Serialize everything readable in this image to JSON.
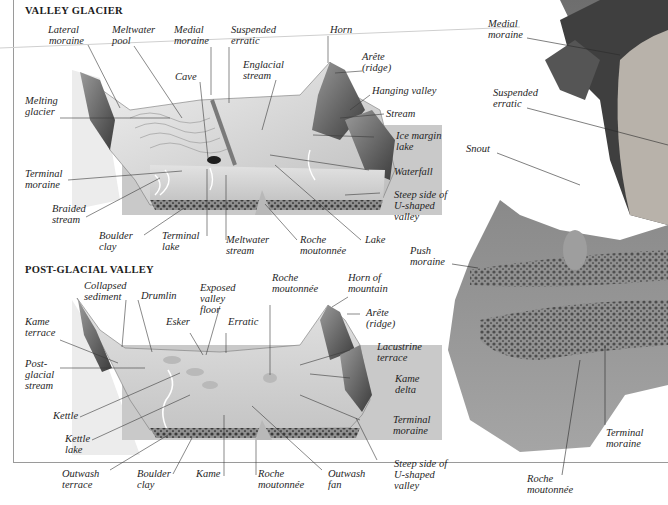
{
  "sections": {
    "valley_glacier": {
      "title": "VALLEY GLACIER",
      "labels": [
        {
          "id": "lateral-moraine",
          "lines": [
            "Lateral",
            "moraine"
          ]
        },
        {
          "id": "meltwater-pool",
          "lines": [
            "Meltwater",
            "pool"
          ]
        },
        {
          "id": "medial-moraine",
          "lines": [
            "Medial",
            "moraine"
          ]
        },
        {
          "id": "suspended-erratic",
          "lines": [
            "Suspended",
            "erratic"
          ]
        },
        {
          "id": "horn",
          "lines": [
            "Horn"
          ]
        },
        {
          "id": "arete",
          "lines": [
            "Arête",
            "(ridge)"
          ]
        },
        {
          "id": "cave",
          "lines": [
            "Cave"
          ]
        },
        {
          "id": "englacial-stream",
          "lines": [
            "Englacial",
            "stream"
          ]
        },
        {
          "id": "hanging-valley",
          "lines": [
            "Hanging valley"
          ]
        },
        {
          "id": "melting-glacier",
          "lines": [
            "Melting",
            "glacier"
          ]
        },
        {
          "id": "stream",
          "lines": [
            "Stream"
          ]
        },
        {
          "id": "ice-margin-lake",
          "lines": [
            "Ice margin",
            "lake"
          ]
        },
        {
          "id": "waterfall",
          "lines": [
            "Waterfall"
          ]
        },
        {
          "id": "terminal-moraine",
          "lines": [
            "Terminal",
            "moraine"
          ]
        },
        {
          "id": "steep-side",
          "lines": [
            "Steep side of",
            "U-shaped",
            "valley"
          ]
        },
        {
          "id": "braided-stream",
          "lines": [
            "Braided",
            "stream"
          ]
        },
        {
          "id": "boulder-clay",
          "lines": [
            "Boulder",
            "clay"
          ]
        },
        {
          "id": "terminal-lake",
          "lines": [
            "Terminal",
            "lake"
          ]
        },
        {
          "id": "meltwater-stream",
          "lines": [
            "Meltwater",
            "stream"
          ]
        },
        {
          "id": "roche-moutonnee",
          "lines": [
            "Roche",
            "moutonnée"
          ]
        },
        {
          "id": "lake",
          "lines": [
            "Lake"
          ]
        }
      ]
    },
    "post_glacial_valley": {
      "title": "POST-GLACIAL VALLEY",
      "labels": [
        {
          "id": "collapsed-sediment",
          "lines": [
            "Collapsed",
            "sediment"
          ]
        },
        {
          "id": "drumlin",
          "lines": [
            "Drumlin"
          ]
        },
        {
          "id": "exposed-valley-floor",
          "lines": [
            "Exposed",
            "valley",
            "floor"
          ]
        },
        {
          "id": "roche-moutonnee",
          "lines": [
            "Roche",
            "moutonnée"
          ]
        },
        {
          "id": "horn-of-mountain",
          "lines": [
            "Horn of",
            "mountain"
          ]
        },
        {
          "id": "kame-terrace",
          "lines": [
            "Kame",
            "terrace"
          ]
        },
        {
          "id": "esker",
          "lines": [
            "Esker"
          ]
        },
        {
          "id": "erratic",
          "lines": [
            "Erratic"
          ]
        },
        {
          "id": "arete",
          "lines": [
            "Arête",
            "(ridge)"
          ]
        },
        {
          "id": "lacustrine-terrace",
          "lines": [
            "Lacustrine",
            "terrace"
          ]
        },
        {
          "id": "post-glacial-stream",
          "lines": [
            "Post-",
            "glacial",
            "stream"
          ]
        },
        {
          "id": "kame-delta",
          "lines": [
            "Kame",
            "delta"
          ]
        },
        {
          "id": "kettle",
          "lines": [
            "Kettle"
          ]
        },
        {
          "id": "terminal-moraine",
          "lines": [
            "Terminal",
            "moraine"
          ]
        },
        {
          "id": "kettle-lake",
          "lines": [
            "Kettle",
            "lake"
          ]
        },
        {
          "id": "outwash-terrace",
          "lines": [
            "Outwash",
            "terrace"
          ]
        },
        {
          "id": "boulder-clay",
          "lines": [
            "Boulder",
            "clay"
          ]
        },
        {
          "id": "kame",
          "lines": [
            "Kame"
          ]
        },
        {
          "id": "roche-moutonnee-2",
          "lines": [
            "Roche",
            "moutonnée"
          ]
        },
        {
          "id": "outwash-fan",
          "lines": [
            "Outwash",
            "fan"
          ]
        },
        {
          "id": "steep-side",
          "lines": [
            "Steep side of",
            "U-shaped",
            "valley"
          ]
        }
      ]
    },
    "photo_panel": {
      "labels": [
        {
          "id": "medial-moraine",
          "lines": [
            "Medial",
            "moraine"
          ]
        },
        {
          "id": "suspended-erratic",
          "lines": [
            "Suspended",
            "erratic"
          ]
        },
        {
          "id": "snout",
          "lines": [
            "Snout"
          ]
        },
        {
          "id": "push-moraine",
          "lines": [
            "Push",
            "moraine"
          ]
        },
        {
          "id": "terminal-moraine",
          "lines": [
            "Terminal",
            "moraine"
          ]
        },
        {
          "id": "roche-moutonnee",
          "lines": [
            "Roche",
            "moutonnée"
          ]
        }
      ]
    }
  }
}
